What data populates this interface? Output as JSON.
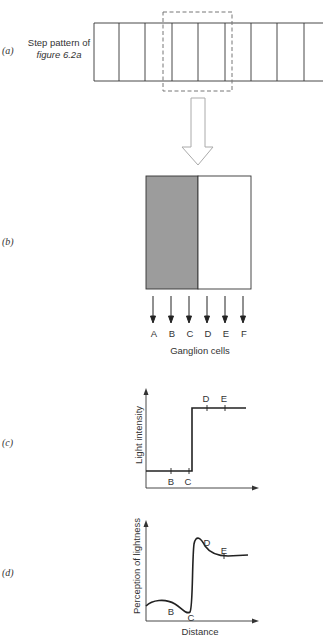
{
  "panels": {
    "a": {
      "label": "(a)",
      "caption_line1": "Step pattern of",
      "caption_line2": "figure 6.2a"
    },
    "b": {
      "label": "(b)",
      "cells": [
        "A",
        "B",
        "C",
        "D",
        "E",
        "F"
      ],
      "caption": "Ganglion cells"
    },
    "c": {
      "label": "(c)",
      "ylabel": "Light intensity",
      "points": [
        "B",
        "C",
        "D",
        "E"
      ]
    },
    "d": {
      "label": "(d)",
      "ylabel": "Perception of lightness",
      "xlabel": "Distance",
      "points": [
        "B",
        "C",
        "D",
        "E"
      ]
    }
  },
  "colors": {
    "stroke": "#333333",
    "dark_field": "#9c9c9c",
    "light_field": "#ffffff",
    "arrow_outline": "#aaaaaa",
    "dashed_box": "#777777"
  }
}
